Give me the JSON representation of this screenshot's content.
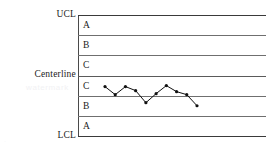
{
  "chart_data": {
    "type": "line",
    "xlabel": "",
    "ylabel": "",
    "grid": true,
    "legend": "none",
    "ylim": [
      -3,
      3
    ],
    "limits": {
      "ucl_label": "UCL",
      "centerline_label": "Centerline",
      "lcl_label": "LCL",
      "ucl_value": 3,
      "centerline_value": 0,
      "lcl_value": -3
    },
    "zones": [
      {
        "label": "A",
        "upper": 3,
        "lower": 2,
        "side": "upper"
      },
      {
        "label": "B",
        "upper": 2,
        "lower": 1,
        "side": "upper"
      },
      {
        "label": "C",
        "upper": 1,
        "lower": 0,
        "side": "upper"
      },
      {
        "label": "C",
        "upper": 0,
        "lower": -1,
        "side": "lower"
      },
      {
        "label": "B",
        "upper": -1,
        "lower": -2,
        "side": "lower"
      },
      {
        "label": "A",
        "upper": -2,
        "lower": -3,
        "side": "lower"
      }
    ],
    "gridline_values": [
      3,
      2,
      1,
      0,
      -1,
      -2,
      -3
    ],
    "x": [
      1,
      2,
      3,
      4,
      5,
      6,
      7,
      8,
      9,
      10
    ],
    "values": [
      -0.55,
      -0.95,
      -0.55,
      -0.75,
      -1.35,
      -0.9,
      -0.5,
      -0.8,
      -0.95,
      -1.5
    ],
    "series": [
      {
        "name": "sample-measurements",
        "values": [
          -0.55,
          -0.95,
          -0.55,
          -0.75,
          -1.35,
          -0.9,
          -0.5,
          -0.8,
          -0.95,
          -1.5
        ]
      }
    ],
    "marker": "filled-circle",
    "line_color": "#111111",
    "marker_color": "#111111",
    "gridline_color": "#6f6f6f"
  },
  "axis": {
    "ucl": "UCL",
    "centerline": "Centerline",
    "lcl": "LCL"
  },
  "zone_labels": [
    "A",
    "B",
    "C",
    "C",
    "B",
    "A"
  ],
  "artifacts": {
    "watermark_main": "watermark",
    "watermark_corner": "·"
  }
}
